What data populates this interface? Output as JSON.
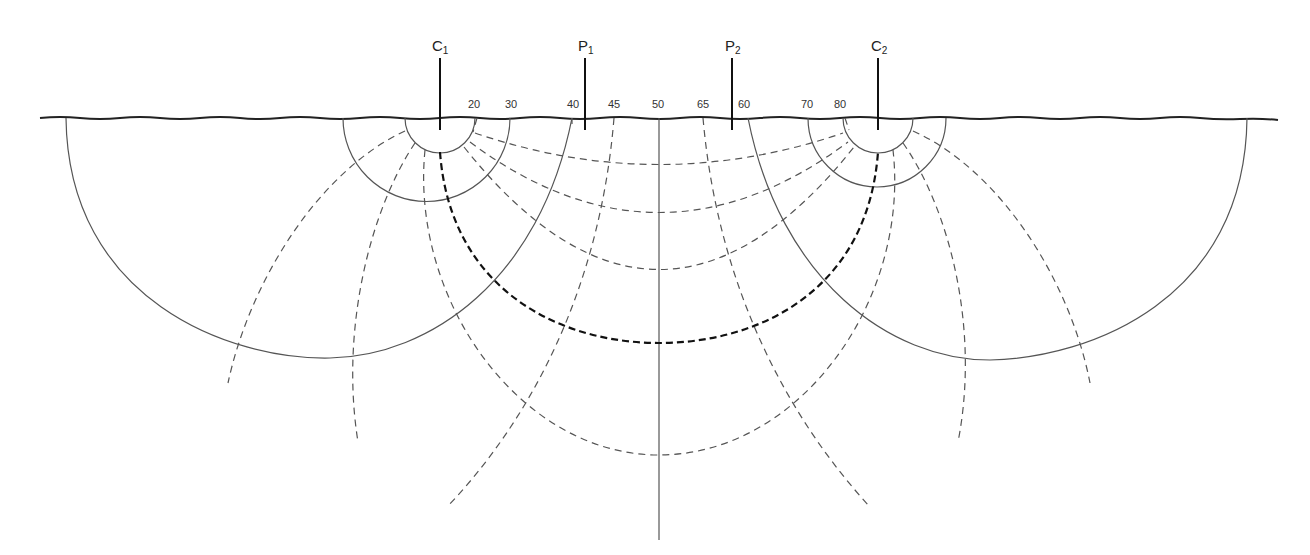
{
  "diagram": {
    "electrodes": [
      {
        "id": "C1",
        "letter": "C",
        "sub": "1",
        "x": 440
      },
      {
        "id": "P1",
        "letter": "P",
        "sub": "1",
        "x": 585
      },
      {
        "id": "P2",
        "letter": "P",
        "sub": "2",
        "x": 732
      },
      {
        "id": "C2",
        "letter": "C",
        "sub": "2",
        "x": 878
      }
    ],
    "surface_labels": [
      {
        "text": "20",
        "x": 477
      },
      {
        "text": "30",
        "x": 512
      },
      {
        "text": "40",
        "x": 573
      },
      {
        "text": "45",
        "x": 614
      },
      {
        "text": "50",
        "x": 659
      },
      {
        "text": "65",
        "x": 703
      },
      {
        "text": "60",
        "x": 744
      },
      {
        "text": "70",
        "x": 808
      },
      {
        "text": "80",
        "x": 842
      }
    ],
    "legend": {
      "solid": "equipotential lines",
      "dashed": "current flow lines",
      "bold_dashed": "current flow line through electrode midline"
    },
    "colors": {
      "line": "#444444",
      "surface": "#222222",
      "bold": "#111111"
    }
  }
}
